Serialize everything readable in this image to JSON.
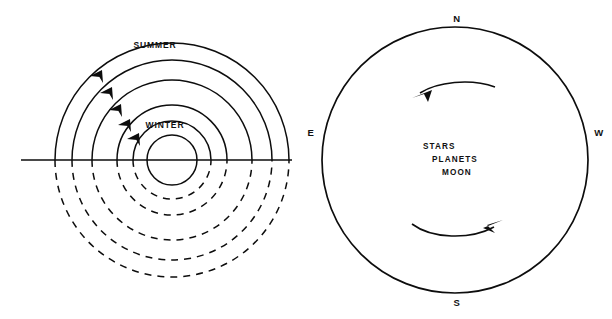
{
  "figure": {
    "background_color": "#ffffff",
    "ink_color": "#0d0d0d"
  },
  "left_panel": {
    "name": "seasonal-sun-paths",
    "description": "Concentric day-arcs of the Sun above and below the horizon",
    "season_labels": {
      "outer": "SUMMER",
      "inner": "WINTER"
    },
    "horizon": {
      "label": "horizon-line",
      "x_start": 21,
      "x_end": 292,
      "y": 160
    },
    "center": {
      "x": 172,
      "y": 160
    },
    "arcs": [
      {
        "id": "arc-summer",
        "radius": 117,
        "above_style": "solid",
        "below_style": "dashed",
        "arrow": true
      },
      {
        "id": "arc-late",
        "radius": 100,
        "above_style": "solid",
        "below_style": "dashed",
        "arrow": true
      },
      {
        "id": "arc-equinox",
        "radius": 80,
        "above_style": "solid",
        "below_style": "dashed",
        "arrow": true
      },
      {
        "id": "arc-early",
        "radius": 55,
        "above_style": "solid",
        "below_style": "dashed",
        "arrow": true
      },
      {
        "id": "arc-winter",
        "radius": 39,
        "above_style": "solid",
        "below_style": "dashed",
        "arrow": true
      },
      {
        "id": "arc-circumpolar",
        "radius": 25,
        "above_style": "solid",
        "below_style": "solid",
        "arrow": false
      }
    ],
    "arrow_direction": "up-and-to-the-right along each arc"
  },
  "right_panel": {
    "name": "celestial-sphere",
    "center": {
      "x": 455,
      "y": 160
    },
    "radius": 133,
    "cardinals": [
      {
        "id": "cardinal-n",
        "label": "N",
        "position": "top",
        "x": 455,
        "y": 18
      },
      {
        "id": "cardinal-e",
        "label": "E",
        "position": "left",
        "x": 310,
        "y": 133
      },
      {
        "id": "cardinal-w",
        "label": "W",
        "position": "right",
        "x": 598,
        "y": 133
      },
      {
        "id": "cardinal-s",
        "label": "S",
        "position": "bottom",
        "x": 455,
        "y": 303
      }
    ],
    "objects": [
      {
        "id": "object-stars",
        "label": "STARS"
      },
      {
        "id": "object-planets",
        "label": "PLANETS"
      },
      {
        "id": "object-moon",
        "label": "MOON"
      }
    ],
    "motion_arrows": [
      {
        "id": "motion-arrow-upper",
        "direction": "leftward",
        "position": "above-center"
      },
      {
        "id": "motion-arrow-lower",
        "direction": "rightward",
        "position": "below-center"
      }
    ]
  }
}
